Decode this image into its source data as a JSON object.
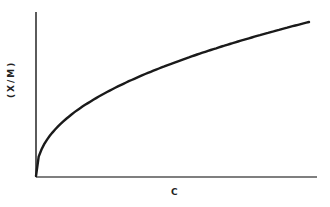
{
  "chart_data": {
    "type": "line",
    "title": "",
    "xlabel": "C",
    "ylabel": "(X/M)",
    "grid": false,
    "legend": null,
    "ticks": {
      "x": [],
      "y": []
    },
    "series": [
      {
        "name": "isotherm",
        "description": "Concave-down monotonic increasing curve from origin (Freundlich-type, x/m proportional to C^(1/n))",
        "x": [
          0,
          0.02,
          0.05,
          0.1,
          0.2,
          0.3,
          0.4,
          0.5,
          0.6,
          0.7,
          0.8,
          0.9,
          1.0
        ],
        "y": [
          0,
          0.17,
          0.26,
          0.35,
          0.48,
          0.58,
          0.66,
          0.73,
          0.79,
          0.85,
          0.9,
          0.95,
          1.0
        ]
      }
    ],
    "xlim": [
      0,
      1.03
    ],
    "ylim": [
      0,
      1.07
    ]
  },
  "axes": {
    "x_label": "C",
    "y_label": "(X/M)"
  }
}
